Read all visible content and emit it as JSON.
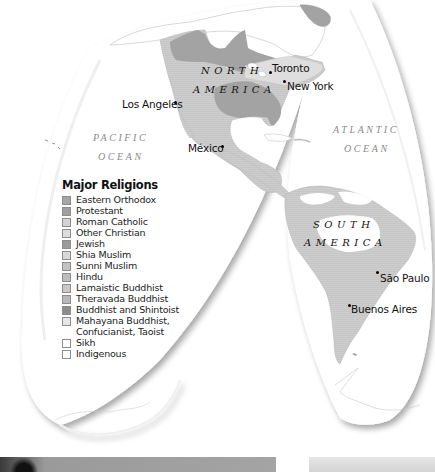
{
  "continents": [
    {
      "id": "north-america",
      "line1": "NORTH",
      "line2": "AMERICA"
    },
    {
      "id": "south-america",
      "line1": "SOUTH",
      "line2": "AMERICA"
    }
  ],
  "oceans": [
    {
      "id": "pacific",
      "line1": "PACIFIC",
      "line2": "OCEAN"
    },
    {
      "id": "atlantic",
      "line1": "ATLANTIC",
      "line2": "OCEAN"
    }
  ],
  "cities": [
    {
      "name": "Toronto"
    },
    {
      "name": "New York"
    },
    {
      "name": "Los Angeles"
    },
    {
      "name": "México"
    },
    {
      "name": "São Paulo"
    },
    {
      "name": "Buenos Aires"
    }
  ],
  "legend": {
    "title": "Major Religions",
    "items": [
      {
        "label": "Eastern Orthodox",
        "color": "#a6a6a6"
      },
      {
        "label": "Protestant",
        "color": "#a0a0a0"
      },
      {
        "label": "Roman Catholic",
        "color": "#d4d4d4"
      },
      {
        "label": "Other Christian",
        "color": "#dcdcdc"
      },
      {
        "label": "Jewish",
        "color": "#9a9a9a"
      },
      {
        "label": "Shia Muslim",
        "color": "#d8d8d8"
      },
      {
        "label": "Sunni Muslim",
        "color": "#c2c2c2"
      },
      {
        "label": "Hindu",
        "color": "#bdbdbd"
      },
      {
        "label": "Lamaistic Buddhist",
        "color": "#c8c8c8"
      },
      {
        "label": "Theravada Buddhist",
        "color": "#b8b8b8"
      },
      {
        "label": "Buddhist and Shintoist",
        "color": "#8c8c8c"
      },
      {
        "label": "Mahayana Buddhist,",
        "label2": "Confucianist, Taoist",
        "color": "#e6e6e6"
      },
      {
        "label": "Sikh",
        "color": "#ffffff"
      },
      {
        "label": "Indigenous",
        "color": "#ffffff"
      }
    ]
  },
  "colors": {
    "protestant_region": "#a3a3a3",
    "catholic_region": "#cfcfcf",
    "other_christian_region": "#dedede",
    "land_outline": "#bdbdbd",
    "globe_shadow": "#e0e0e0"
  }
}
